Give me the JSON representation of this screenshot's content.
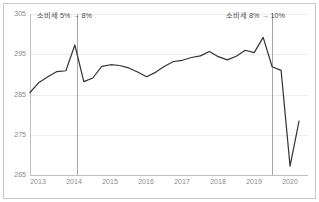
{
  "chart_data": {
    "type": "line",
    "title": "",
    "xlabel": "",
    "ylabel": "",
    "ylim": [
      265,
      305
    ],
    "xlim": [
      2013.0,
      2020.75
    ],
    "grid": true,
    "legend": "none",
    "yticks": [
      "305",
      "295",
      "285",
      "275",
      "265"
    ],
    "ytick_values": [
      305,
      295,
      285,
      275,
      265
    ],
    "xticks": [
      "2013",
      "2014",
      "2015",
      "2016",
      "2017",
      "2018",
      "2019",
      "2020"
    ],
    "xtick_values": [
      2013,
      2014,
      2015,
      2016,
      2017,
      2018,
      2019,
      2020
    ],
    "series": [
      {
        "name": "consumption",
        "color": "#333333",
        "x": [
          2013.0,
          2013.25,
          2013.5,
          2013.75,
          2014.0,
          2014.25,
          2014.5,
          2014.75,
          2015.0,
          2015.25,
          2015.5,
          2015.75,
          2016.0,
          2016.25,
          2016.5,
          2016.75,
          2017.0,
          2017.25,
          2017.5,
          2017.75,
          2018.0,
          2018.25,
          2018.5,
          2018.75,
          2019.0,
          2019.25,
          2019.5,
          2019.75,
          2020.0,
          2020.25,
          2020.5
        ],
        "values": [
          285.5,
          288.0,
          289.4,
          290.7,
          290.9,
          297.3,
          288.2,
          289.1,
          292.0,
          292.4,
          292.2,
          291.6,
          290.6,
          289.4,
          290.5,
          292.0,
          293.2,
          293.5,
          294.2,
          294.6,
          295.7,
          294.4,
          293.6,
          294.5,
          296.0,
          295.4,
          299.2,
          291.9,
          291.0,
          267.2,
          278.4
        ]
      }
    ],
    "annotations": [
      {
        "name": "tax-hike-2014",
        "label": "소비세 5% → 8%",
        "x_value": 2014.25,
        "line": "vertical"
      },
      {
        "name": "tax-hike-2019",
        "label": "소비세 8% → 10%",
        "x_value": 2019.75,
        "line": "vertical"
      }
    ]
  },
  "colors": {
    "line": "#333333",
    "grid": "#ededed",
    "axis": "#bfbfbf",
    "tick_text": "#8a8a8a",
    "annotation_text": "#4a4a4a",
    "annotation_line": "#a6a6a6",
    "frame": "#c9c9c9",
    "background": "#ffffff"
  }
}
